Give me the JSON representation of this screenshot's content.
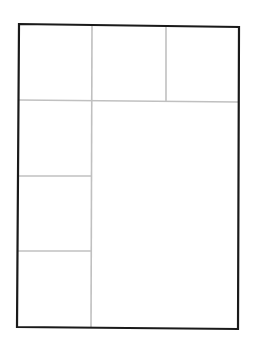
{
  "diagram": {
    "type": "layout-grid",
    "colors": {
      "frame": "#1a1a1a",
      "grid": "#c0c0c0",
      "background": "#ffffff"
    },
    "panels": [
      {
        "id": "top-1"
      },
      {
        "id": "top-2"
      },
      {
        "id": "top-3"
      },
      {
        "id": "left-1"
      },
      {
        "id": "left-2"
      },
      {
        "id": "left-3"
      },
      {
        "id": "main"
      }
    ]
  }
}
